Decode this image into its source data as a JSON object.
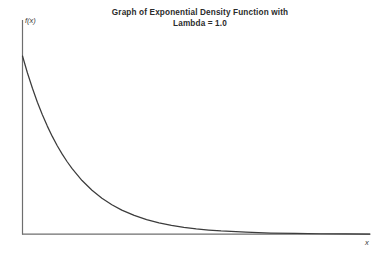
{
  "chart_data": {
    "type": "line",
    "title": "Graph of Exponential Density Function with Lambda = 1.0",
    "title_lines": [
      "Graph of Exponential Density Function with",
      "Lambda = 1.0"
    ],
    "xlabel": "x",
    "ylabel": "f(x)",
    "lambda": 1.0,
    "function": "f(x) = lambda * exp(-lambda * x)",
    "grid": false,
    "legend": null,
    "xlim": [
      0,
      7
    ],
    "ylim": [
      0,
      1.15
    ],
    "tick_labels": {
      "x": [],
      "y": []
    },
    "series": [
      {
        "name": "Exponential density, lambda = 1.0",
        "color": "#3c3c3c",
        "x": [
          0,
          0.1,
          0.2,
          0.3,
          0.4,
          0.5,
          0.6,
          0.7,
          0.8,
          0.9,
          1.0,
          1.2,
          1.4,
          1.6,
          1.8,
          2.0,
          2.25,
          2.5,
          2.75,
          3.0,
          3.25,
          3.5,
          3.75,
          4.0,
          4.5,
          5.0,
          5.5,
          6.0,
          6.5,
          7.0
        ],
        "values": [
          1.0,
          0.9048,
          0.8187,
          0.7408,
          0.6703,
          0.6065,
          0.5488,
          0.4966,
          0.4493,
          0.4066,
          0.3679,
          0.3012,
          0.2466,
          0.2019,
          0.1653,
          0.1353,
          0.1054,
          0.0821,
          0.0639,
          0.0498,
          0.0388,
          0.0302,
          0.0235,
          0.0183,
          0.0111,
          0.0067,
          0.0041,
          0.0025,
          0.0015,
          0.0009
        ]
      }
    ]
  },
  "colors": {
    "background": "#ffffff",
    "axis": "#6e6e6e",
    "curve": "#3c3c3c",
    "title_text": "#2b2b2b",
    "label_text": "#3a3a3a"
  }
}
